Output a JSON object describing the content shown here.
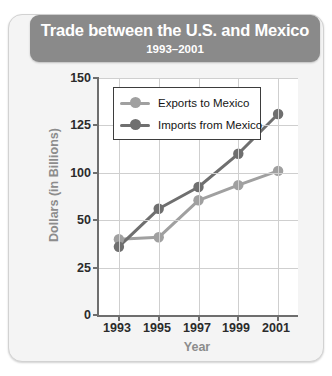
{
  "card": {
    "title_main": "Trade between the U.S. and Mexico",
    "title_sub": "1993–2001"
  },
  "legend": {
    "items": [
      {
        "label": "Exports to Mexico",
        "color": "#a0a0a0"
      },
      {
        "label": "Imports from Mexico",
        "color": "#6f6f6f"
      }
    ]
  },
  "axes": {
    "y_title": "Dollars (in Billions)",
    "x_title": "Year",
    "y_ticks": [
      "150",
      "125",
      "100",
      "50",
      "25",
      "0"
    ],
    "x_ticks": [
      "1993",
      "1995",
      "1997",
      "1999",
      "2001"
    ]
  },
  "colors": {
    "exports": "#a0a0a0",
    "imports": "#6f6f6f",
    "banner": "#8a8a8a",
    "grid": "#cfcfcf",
    "axis": "#6e6e6e",
    "card_bg": "#f4f4f4",
    "plot_bg": "#ffffff",
    "axis_title": "#8c8c8c"
  },
  "chart_data": {
    "type": "line",
    "title": "Trade between the U.S. and Mexico",
    "subtitle": "1993–2001",
    "xlabel": "Year",
    "ylabel": "Dollars (in Billions)",
    "x": [
      1993,
      1995,
      1997,
      1999,
      2001
    ],
    "xtick_labels": [
      "1993",
      "1995",
      "1997",
      "1999",
      "2001"
    ],
    "ytick_labels": [
      "0",
      "25",
      "50",
      "100",
      "125",
      "150"
    ],
    "ytick_values": [
      0,
      25,
      50,
      100,
      125,
      150
    ],
    "ylim": [
      0,
      150
    ],
    "grid": true,
    "legend_position": "upper-left-inside",
    "note": "Y-axis tick labels are evenly spaced on the original figure; the third label from the top reads 50 where 75 would be expected.",
    "series": [
      {
        "name": "Exports to Mexico",
        "color": "#a0a0a0",
        "values": [
          40,
          41,
          71,
          87,
          101
        ]
      },
      {
        "name": "Imports from Mexico",
        "color": "#6f6f6f",
        "values": [
          36,
          62,
          85,
          110,
          131
        ]
      }
    ]
  }
}
